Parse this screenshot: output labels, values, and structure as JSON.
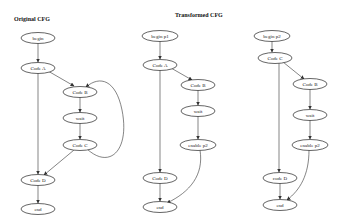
{
  "titles": {
    "original": "Original CFG",
    "transformed": "Transformed CFG"
  },
  "graphs": [
    {
      "name": "original",
      "nodes": {
        "begin": "begin",
        "a": "Code A",
        "b": "Code B",
        "wait": "wait",
        "c": "Code C",
        "d": "Code D",
        "end": "end"
      },
      "edges": [
        [
          "begin",
          "Code A"
        ],
        [
          "Code A",
          "Code B"
        ],
        [
          "Code B",
          "wait"
        ],
        [
          "wait",
          "Code C"
        ],
        [
          "Code C",
          "Code B"
        ],
        [
          "Code C",
          "Code D"
        ],
        [
          "Code A",
          "Code D"
        ],
        [
          "Code D",
          "end"
        ]
      ]
    },
    {
      "name": "transformed-p1",
      "nodes": {
        "begin": "begin p1",
        "a": "Code A",
        "b": "Code B",
        "wait": "wait",
        "enable": "enable p2",
        "d": "Code D",
        "end": "end"
      },
      "edges": [
        [
          "begin p1",
          "Code A"
        ],
        [
          "Code A",
          "Code B"
        ],
        [
          "Code B",
          "wait"
        ],
        [
          "wait",
          "enable p2"
        ],
        [
          "enable p2",
          "end"
        ],
        [
          "Code A",
          "Code D"
        ],
        [
          "Code D",
          "end"
        ]
      ]
    },
    {
      "name": "transformed-p2",
      "nodes": {
        "begin": "begin p2",
        "c": "Code C",
        "b": "Code B",
        "wait": "wait",
        "enable": "enable p2",
        "d": "code D",
        "end": "end"
      },
      "edges": [
        [
          "begin p2",
          "Code C"
        ],
        [
          "Code C",
          "Code B"
        ],
        [
          "Code B",
          "wait"
        ],
        [
          "wait",
          "enable p2"
        ],
        [
          "enable p2",
          "end"
        ],
        [
          "Code C",
          "code D"
        ],
        [
          "code D",
          "end"
        ]
      ]
    }
  ]
}
